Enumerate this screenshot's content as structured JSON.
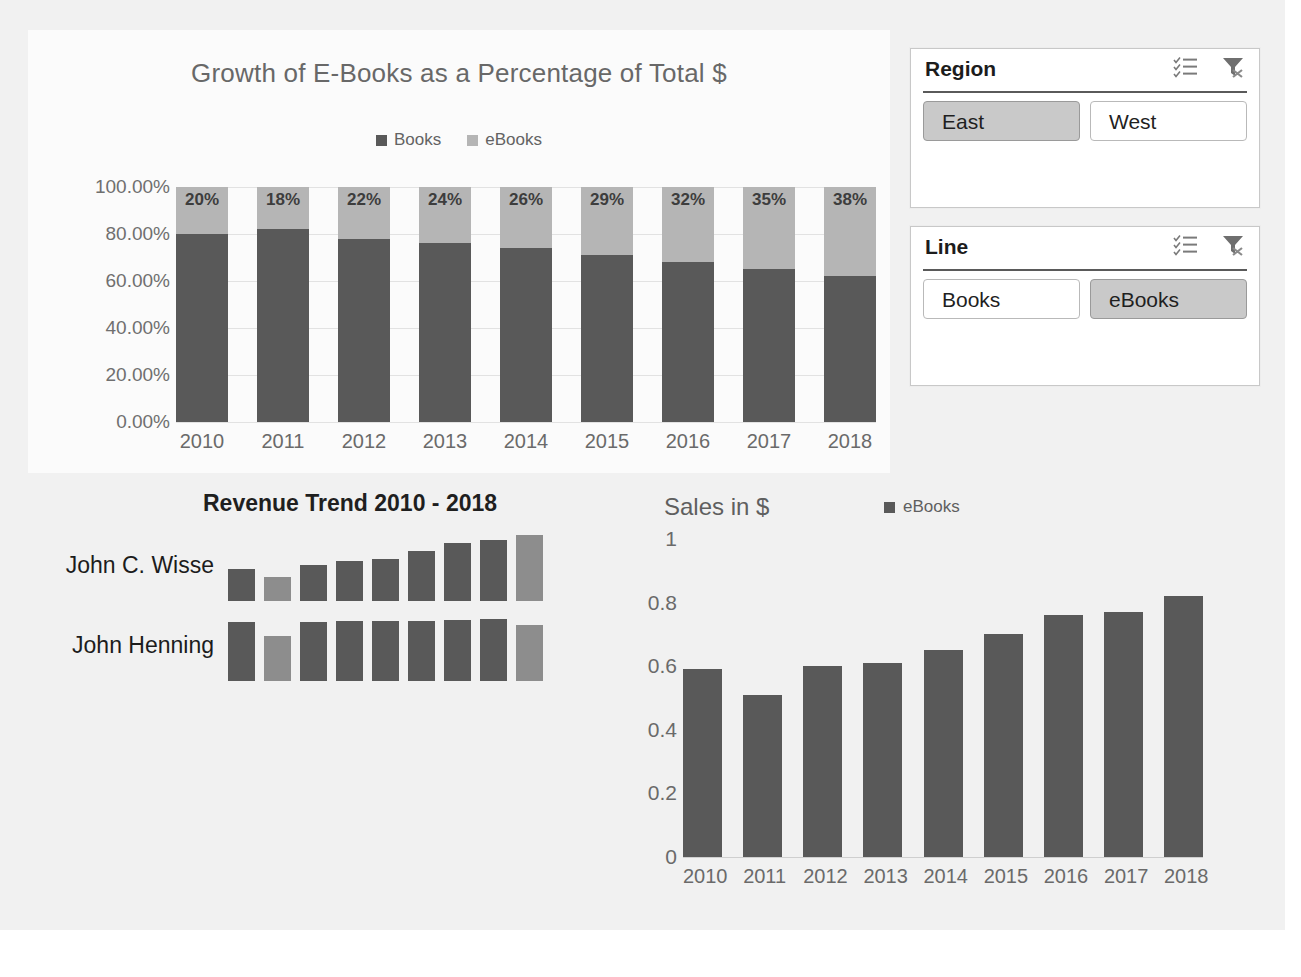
{
  "theme": {
    "series_dark": "#595959",
    "series_light": "#b5b5b5",
    "canvas_bg": "#f1f1f1",
    "panel_bg": "#fbfbfb",
    "selected_bg": "#c9c9c9"
  },
  "slicers": [
    {
      "id": "region",
      "title": "Region",
      "multi_select_icon": "multi-select-icon",
      "clear_filter_icon": "clear-filter-icon",
      "items": [
        {
          "label": "East",
          "selected": true
        },
        {
          "label": "West",
          "selected": false
        }
      ]
    },
    {
      "id": "line",
      "title": "Line",
      "multi_select_icon": "multi-select-icon",
      "clear_filter_icon": "clear-filter-icon",
      "items": [
        {
          "label": "Books",
          "selected": false
        },
        {
          "label": "eBooks",
          "selected": true
        }
      ]
    }
  ],
  "sparkline_block": {
    "title": "Revenue Trend 2010 - 2018",
    "rows": [
      {
        "name": "John C. Wisse",
        "values": [
          0.44,
          0.34,
          0.5,
          0.56,
          0.59,
          0.7,
          0.81,
          0.85,
          0.92
        ],
        "accent_indices": [
          1,
          8
        ]
      },
      {
        "name": "John Henning",
        "values": [
          0.82,
          0.62,
          0.82,
          0.83,
          0.83,
          0.84,
          0.85,
          0.86,
          0.78
        ],
        "accent_indices": [
          1,
          8
        ]
      }
    ]
  },
  "chart_data": [
    {
      "id": "stacked-percent-chart",
      "type": "bar",
      "stacked": true,
      "title": "Growth of E-Books as a Percentage of Total $",
      "xlabel": "",
      "ylabel": "",
      "categories": [
        "2010",
        "2011",
        "2012",
        "2013",
        "2014",
        "2015",
        "2016",
        "2017",
        "2018"
      ],
      "ytick_labels": [
        "100.00%",
        "80.00%",
        "60.00%",
        "40.00%",
        "20.00%",
        "0.00%"
      ],
      "ytick_values": [
        100,
        80,
        60,
        40,
        20,
        0
      ],
      "ylim": [
        0,
        100
      ],
      "grid": true,
      "legend": [
        "Books",
        "eBooks"
      ],
      "legend_position": "top",
      "series": [
        {
          "name": "Books",
          "color": "#595959",
          "values": [
            80,
            82,
            78,
            76,
            74,
            71,
            68,
            65,
            62
          ]
        },
        {
          "name": "eBooks",
          "color": "#b5b5b5",
          "values": [
            20,
            18,
            22,
            24,
            26,
            29,
            32,
            35,
            38
          ]
        }
      ],
      "data_labels": [
        "20%",
        "18%",
        "22%",
        "24%",
        "26%",
        "29%",
        "32%",
        "35%",
        "38%"
      ]
    },
    {
      "id": "sales-column-chart",
      "type": "bar",
      "stacked": false,
      "title": "Sales in $",
      "xlabel": "",
      "ylabel": "",
      "categories": [
        "2010",
        "2011",
        "2012",
        "2013",
        "2014",
        "2015",
        "2016",
        "2017",
        "2018"
      ],
      "ytick_labels": [
        "1",
        "0.8",
        "0.6",
        "0.4",
        "0.2",
        "0"
      ],
      "ytick_values": [
        1,
        0.8,
        0.6,
        0.4,
        0.2,
        0
      ],
      "ylim": [
        0,
        1
      ],
      "grid": false,
      "legend": [
        "eBooks"
      ],
      "legend_position": "top-right",
      "series": [
        {
          "name": "eBooks",
          "color": "#595959",
          "values": [
            0.59,
            0.51,
            0.6,
            0.61,
            0.65,
            0.7,
            0.76,
            0.77,
            0.82
          ]
        }
      ]
    }
  ]
}
